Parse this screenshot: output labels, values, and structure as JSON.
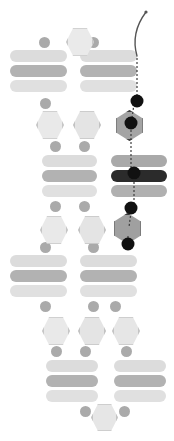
{
  "canvas": {
    "width": 174,
    "height": 441,
    "background": "#ffffff",
    "title": "Abstract stacked-module schematic with traced path"
  },
  "palette": {
    "pill_light": "#dcdcdc",
    "pill_mid": "#b4b4b4",
    "pill_pale": "#e2e2e2",
    "pill_dark": "#2b2b2b",
    "pill_shade": "#9a9a9a",
    "dot_grey": "#a8a8a8",
    "dot_dark": "#111111",
    "hex_fill": "#e8e8e8",
    "hex_stroke": "#c2c2c2",
    "hex_dark_fill": "#9c9c9c",
    "hex_dark_stroke": "#3a3a3a",
    "thread": "#4a4a4a",
    "path_dash": "#3c3c3c"
  },
  "thread": {
    "name": "curved-probe-thread",
    "path": "M 137 56 C 133 42 134 28 146 12",
    "stroke": "#555555",
    "width": 1.4,
    "tip_x": 146,
    "tip_y": 12
  },
  "trace_path": {
    "name": "vertical-traced-path",
    "segments": [
      "M 137 58 L 137 96",
      "M 134 104 L 132 118",
      "M 131 126 L 131 168",
      "M 134 178 L 134 203",
      "M 131 212 L 129 227",
      "M 128 236 L 128 252"
    ],
    "stroke": "#3c3c3c",
    "width": 1.2,
    "dash": "2 2"
  },
  "nodes": [
    {
      "id": "n1",
      "label": "node-1",
      "cx": 137,
      "cy": 101,
      "r": 6.5,
      "color": "#111111"
    },
    {
      "id": "n2",
      "label": "node-2",
      "cx": 131,
      "cy": 123,
      "r": 6.5,
      "color": "#111111"
    },
    {
      "id": "n3",
      "label": "node-3",
      "cx": 134,
      "cy": 173,
      "r": 6.5,
      "color": "#111111"
    },
    {
      "id": "n4",
      "label": "node-4",
      "cx": 131,
      "cy": 208,
      "r": 6.5,
      "color": "#111111"
    },
    {
      "id": "n5",
      "label": "node-5",
      "cx": 128,
      "cy": 244,
      "r": 6.5,
      "color": "#111111"
    }
  ],
  "groups": [
    {
      "id": "g-top-left",
      "label": "top-left-module",
      "x": 10,
      "y": 48,
      "w": 57,
      "bars": [
        {
          "label": "bar-a",
          "y": 50,
          "h": 12,
          "color": "#dcdcdc"
        },
        {
          "label": "bar-b",
          "y": 65,
          "h": 12,
          "color": "#b2b2b2"
        },
        {
          "label": "bar-c",
          "y": 80,
          "h": 12,
          "color": "#e0e0e0"
        }
      ],
      "dots": [
        {
          "label": "cap-dot",
          "cx": 44,
          "cy": 42,
          "r": 5.5,
          "color": "#aaaaaa"
        },
        {
          "label": "foot-dot",
          "cx": 45,
          "cy": 103,
          "r": 5.5,
          "color": "#aaaaaa"
        }
      ]
    },
    {
      "id": "g-top-right",
      "label": "top-right-module",
      "x": 80,
      "y": 48,
      "w": 57,
      "bars": [
        {
          "label": "bar-a",
          "y": 50,
          "h": 12,
          "color": "#dcdcdc"
        },
        {
          "label": "bar-b",
          "y": 65,
          "h": 12,
          "color": "#b2b2b2"
        },
        {
          "label": "bar-c",
          "y": 80,
          "h": 12,
          "color": "#e0e0e0"
        }
      ],
      "dots": [
        {
          "label": "cap-dot",
          "cx": 93,
          "cy": 42,
          "r": 5.5,
          "color": "#aaaaaa"
        }
      ]
    },
    {
      "id": "g-mid-left",
      "label": "middle-left-module",
      "x": 42,
      "y": 155,
      "w": 55,
      "bars": [
        {
          "label": "bar-a",
          "y": 155,
          "h": 12,
          "color": "#dcdcdc"
        },
        {
          "label": "bar-b",
          "y": 170,
          "h": 12,
          "color": "#b2b2b2"
        },
        {
          "label": "bar-c",
          "y": 185,
          "h": 12,
          "color": "#e0e0e0"
        }
      ],
      "dots": [
        {
          "label": "cap-dot-1",
          "cx": 55,
          "cy": 146,
          "r": 5.5,
          "color": "#aaaaaa"
        },
        {
          "label": "cap-dot-2",
          "cx": 84,
          "cy": 146,
          "r": 5.5,
          "color": "#aaaaaa"
        },
        {
          "label": "foot-dot-1",
          "cx": 55,
          "cy": 206,
          "r": 5.5,
          "color": "#aaaaaa"
        },
        {
          "label": "foot-dot-2",
          "cx": 84,
          "cy": 206,
          "r": 5.5,
          "color": "#aaaaaa"
        }
      ]
    },
    {
      "id": "g-mid-right",
      "label": "middle-right-module-highlighted",
      "x": 111,
      "y": 155,
      "w": 56,
      "bars": [
        {
          "label": "bar-a",
          "y": 155,
          "h": 12,
          "color": "#a9a9a9"
        },
        {
          "label": "bar-b-selected",
          "y": 170,
          "h": 12,
          "color": "#2b2b2b"
        },
        {
          "label": "bar-c",
          "y": 185,
          "h": 12,
          "color": "#b0b0b0"
        }
      ],
      "dots": []
    },
    {
      "id": "g-low-left",
      "label": "lower-left-module",
      "x": 10,
      "y": 255,
      "w": 57,
      "bars": [
        {
          "label": "bar-a",
          "y": 255,
          "h": 12,
          "color": "#dcdcdc"
        },
        {
          "label": "bar-b",
          "y": 270,
          "h": 12,
          "color": "#b2b2b2"
        },
        {
          "label": "bar-c",
          "y": 285,
          "h": 12,
          "color": "#e0e0e0"
        }
      ],
      "dots": [
        {
          "label": "cap-dot",
          "cx": 45,
          "cy": 247,
          "r": 5.5,
          "color": "#aaaaaa"
        },
        {
          "label": "foot-dot-1",
          "cx": 45,
          "cy": 306,
          "r": 5.5,
          "color": "#aaaaaa"
        }
      ]
    },
    {
      "id": "g-low-right",
      "label": "lower-right-module",
      "x": 80,
      "y": 255,
      "w": 57,
      "bars": [
        {
          "label": "bar-a",
          "y": 255,
          "h": 12,
          "color": "#dcdcdc"
        },
        {
          "label": "bar-b",
          "y": 270,
          "h": 12,
          "color": "#b2b2b2"
        },
        {
          "label": "bar-c",
          "y": 285,
          "h": 12,
          "color": "#e0e0e0"
        }
      ],
      "dots": [
        {
          "label": "cap-dot",
          "cx": 93,
          "cy": 247,
          "r": 5.5,
          "color": "#aaaaaa"
        },
        {
          "label": "foot-dot-1",
          "cx": 93,
          "cy": 306,
          "r": 5.5,
          "color": "#aaaaaa"
        },
        {
          "label": "foot-dot-2",
          "cx": 115,
          "cy": 306,
          "r": 5.5,
          "color": "#aaaaaa"
        }
      ]
    },
    {
      "id": "g-bot-left",
      "label": "bottom-left-module",
      "x": 46,
      "y": 360,
      "w": 52,
      "bars": [
        {
          "label": "bar-a",
          "y": 360,
          "h": 12,
          "color": "#dcdcdc"
        },
        {
          "label": "bar-b",
          "y": 375,
          "h": 12,
          "color": "#b2b2b2"
        },
        {
          "label": "bar-c",
          "y": 390,
          "h": 12,
          "color": "#e0e0e0"
        }
      ],
      "dots": [
        {
          "label": "cap-dot-1",
          "cx": 56,
          "cy": 351,
          "r": 5.5,
          "color": "#aaaaaa"
        },
        {
          "label": "cap-dot-2",
          "cx": 85,
          "cy": 351,
          "r": 5.5,
          "color": "#aaaaaa"
        },
        {
          "label": "foot-dot-1",
          "cx": 85,
          "cy": 411,
          "r": 5.5,
          "color": "#aaaaaa"
        }
      ]
    },
    {
      "id": "g-bot-right",
      "label": "bottom-right-module",
      "x": 114,
      "y": 360,
      "w": 52,
      "bars": [
        {
          "label": "bar-a",
          "y": 360,
          "h": 12,
          "color": "#dcdcdc"
        },
        {
          "label": "bar-b",
          "y": 375,
          "h": 12,
          "color": "#b2b2b2"
        },
        {
          "label": "bar-c",
          "y": 390,
          "h": 12,
          "color": "#e0e0e0"
        }
      ],
      "dots": [
        {
          "label": "cap-dot-1",
          "cx": 126,
          "cy": 351,
          "r": 5.5,
          "color": "#aaaaaa"
        },
        {
          "label": "foot-dot-1",
          "cx": 124,
          "cy": 411,
          "r": 5.5,
          "color": "#aaaaaa"
        }
      ]
    }
  ],
  "hexagons": [
    {
      "id": "h1",
      "label": "hex-top-center",
      "x": 66,
      "y": 27,
      "w": 28,
      "h": 30,
      "fill": "#eaeaea",
      "stroke": "#c8c8c8",
      "rot": false
    },
    {
      "id": "h2",
      "label": "hex-upper-left",
      "x": 36,
      "y": 110,
      "w": 28,
      "h": 30,
      "fill": "#e9e9e9",
      "stroke": "#c6c6c6",
      "rot": false
    },
    {
      "id": "h3",
      "label": "hex-upper-mid",
      "x": 73,
      "y": 110,
      "w": 28,
      "h": 30,
      "fill": "#e4e4e4",
      "stroke": "#c2c2c2",
      "rot": false
    },
    {
      "id": "h4",
      "label": "hex-upper-right-active",
      "x": 115,
      "y": 110,
      "w": 29,
      "h": 31,
      "fill": "#a4a4a4",
      "stroke": "#3e3e3e",
      "rot": true
    },
    {
      "id": "h5",
      "label": "hex-lower-left",
      "x": 40,
      "y": 215,
      "w": 28,
      "h": 30,
      "fill": "#e9e9e9",
      "stroke": "#c6c6c6",
      "rot": false
    },
    {
      "id": "h6",
      "label": "hex-lower-mid",
      "x": 78,
      "y": 215,
      "w": 28,
      "h": 30,
      "fill": "#e4e4e4",
      "stroke": "#c2c2c2",
      "rot": false
    },
    {
      "id": "h7",
      "label": "hex-lower-right-active",
      "x": 113,
      "y": 213,
      "w": 29,
      "h": 31,
      "fill": "#a0a0a0",
      "stroke": "#3a3a3a",
      "rot": true
    },
    {
      "id": "h8",
      "label": "hex-bottom-a",
      "x": 42,
      "y": 316,
      "w": 28,
      "h": 30,
      "fill": "#e9e9e9",
      "stroke": "#c6c6c6",
      "rot": false
    },
    {
      "id": "h9",
      "label": "hex-bottom-b",
      "x": 78,
      "y": 316,
      "w": 28,
      "h": 30,
      "fill": "#e4e4e4",
      "stroke": "#c2c2c2",
      "rot": false
    },
    {
      "id": "h10",
      "label": "hex-bottom-c",
      "x": 112,
      "y": 316,
      "w": 28,
      "h": 30,
      "fill": "#e6e6e6",
      "stroke": "#c4c4c4",
      "rot": false
    },
    {
      "id": "h11",
      "label": "hex-footer-center",
      "x": 91,
      "y": 403,
      "w": 27,
      "h": 29,
      "fill": "#e6e6e6",
      "stroke": "#c4c4c4",
      "rot": false
    }
  ]
}
